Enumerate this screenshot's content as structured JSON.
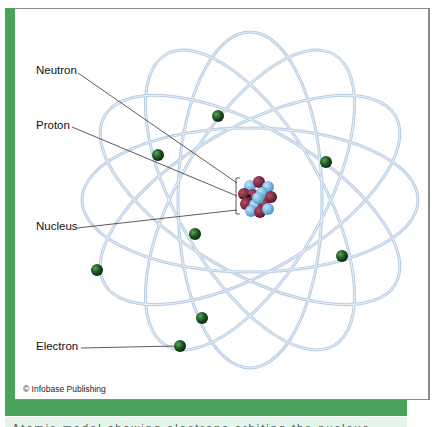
{
  "figure": {
    "labels": {
      "neutron": "Neutron",
      "proton": "Proton",
      "nucleus": "Nucleus",
      "electron": "Electron"
    },
    "credit": "© Infobase Publishing",
    "caption_partial": "Atomic model showing electrons orbiting the nucleus"
  },
  "colors": {
    "frame_green": "#4aa35a",
    "orbit": "#b7cde4",
    "electron": "#1e5a22",
    "proton": "#7a1f35",
    "neutron": "#6fb6e6",
    "mint": "#e4f6ea"
  },
  "electrons": [
    {
      "x": 218,
      "y": 116
    },
    {
      "x": 158,
      "y": 155
    },
    {
      "x": 326,
      "y": 162
    },
    {
      "x": 195,
      "y": 234
    },
    {
      "x": 342,
      "y": 256
    },
    {
      "x": 97,
      "y": 270
    },
    {
      "x": 202,
      "y": 318
    },
    {
      "x": 180,
      "y": 346
    }
  ]
}
